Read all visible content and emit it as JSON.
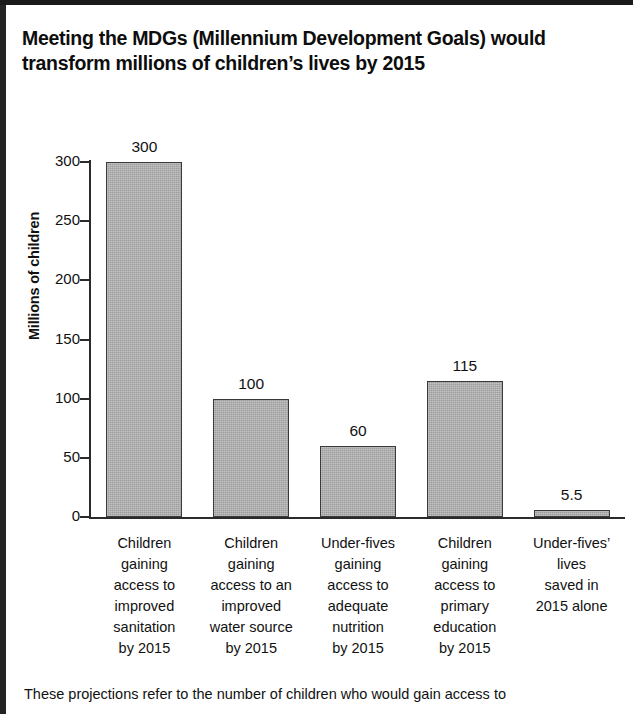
{
  "page": {
    "title_line1": "Meeting the MDGs (Millennium Development Goals) would",
    "title_line2": "transform millions of children’s lives by 2015",
    "footnote": "These projections refer to the number of children who would gain access to"
  },
  "colors": {
    "bar_fill": "#9d9d9d",
    "bar_border": "#3a3a3a",
    "axis": "#2b2b2b",
    "text": "#111111",
    "frame": "#1a1a1a"
  },
  "chart_data": {
    "type": "bar",
    "title": "Meeting the MDGs (Millennium Development Goals) would transform millions of children’s lives by 2015",
    "xlabel": "",
    "ylabel": "Millions of children",
    "ylim": [
      0,
      300
    ],
    "yticks": [
      0,
      50,
      100,
      150,
      200,
      250,
      300
    ],
    "ytick_labels": [
      "0",
      "50",
      "100",
      "150",
      "200",
      "250",
      "300"
    ],
    "grid": false,
    "legend": false,
    "categories": [
      "Children gaining access to improved sanitation by 2015",
      "Children gaining access to an improved water source by 2015",
      "Under-fives gaining access to adequate nutrition by 2015",
      "Children gaining access to primary education by 2015",
      "Under-fives’ lives saved in 2015 alone"
    ],
    "category_lines": [
      [
        "Children",
        "gaining",
        "access to",
        "improved",
        "sanitation",
        "by 2015"
      ],
      [
        "Children",
        "gaining",
        "access to an",
        "improved",
        "water source",
        "by 2015"
      ],
      [
        "Under-fives",
        "gaining",
        "access to",
        "adequate",
        "nutrition",
        "by 2015"
      ],
      [
        "Children",
        "gaining",
        "access to",
        "primary",
        "education",
        "by 2015"
      ],
      [
        "Under-fives’",
        "lives",
        "saved in",
        "2015 alone"
      ]
    ],
    "values": [
      300,
      100,
      60,
      115,
      5.5
    ],
    "value_labels": [
      "300",
      "100",
      "60",
      "115",
      "5.5"
    ]
  }
}
